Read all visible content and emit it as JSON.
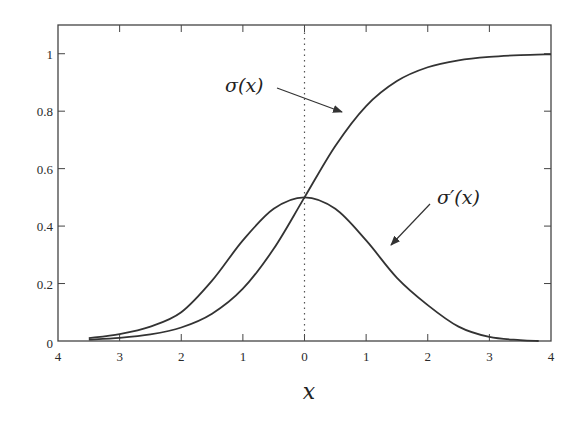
{
  "chart_data": {
    "type": "line",
    "title": "",
    "xlabel": "x",
    "ylabel": "",
    "xlim": [
      -4,
      4
    ],
    "ylim": [
      0,
      1.1
    ],
    "grid": false,
    "legend": "none (curves labeled with arrows)",
    "x_ticks": [
      -4,
      -3,
      -2,
      -1,
      0,
      1,
      2,
      3,
      4
    ],
    "x_tick_labels": [
      "4",
      "3",
      "2",
      "1",
      "0",
      "1",
      "2",
      "3",
      "4"
    ],
    "y_ticks": [
      0,
      0.2,
      0.4,
      0.6,
      0.8,
      1
    ],
    "y_tick_labels": [
      "0",
      "0.2",
      "0.4",
      "0.6",
      "0.8",
      "1"
    ],
    "reference_lines": [
      {
        "type": "vertical",
        "x": 0,
        "style": "dotted"
      }
    ],
    "series": [
      {
        "name": "σ(x)",
        "x": [
          -3.5,
          -3,
          -2.5,
          -2,
          -1.5,
          -1,
          -0.5,
          0,
          0.5,
          1,
          1.5,
          2,
          2.5,
          3,
          3.5,
          4
        ],
        "values": [
          0.005,
          0.011,
          0.023,
          0.047,
          0.095,
          0.182,
          0.321,
          0.5,
          0.679,
          0.818,
          0.905,
          0.953,
          0.977,
          0.989,
          0.995,
          0.998
        ]
      },
      {
        "name": "σ′(x)",
        "x": [
          -3.5,
          -3,
          -2.5,
          -2,
          -1.5,
          -1,
          -0.5,
          0,
          0.5,
          1,
          1.5,
          2,
          2.5,
          3,
          3.5,
          3.8
        ],
        "values": [
          0.01,
          0.024,
          0.05,
          0.1,
          0.21,
          0.35,
          0.46,
          0.5,
          0.46,
          0.35,
          0.22,
          0.125,
          0.05,
          0.014,
          0.003,
          0
        ]
      }
    ],
    "annotations": [
      {
        "text": "σ(x)",
        "label_pos_px": [
          225,
          92
        ],
        "arrow_from_px": [
          277,
          88
        ],
        "arrow_to_px": [
          342,
          112
        ]
      },
      {
        "text": "σ′(x)",
        "label_pos_px": [
          437,
          204
        ],
        "arrow_from_px": [
          430,
          204
        ],
        "arrow_to_px": [
          391,
          245
        ]
      }
    ]
  },
  "labels": {
    "sigma": "σ(x)",
    "sigma_prime": "σ′(x)",
    "x_axis": "x"
  }
}
